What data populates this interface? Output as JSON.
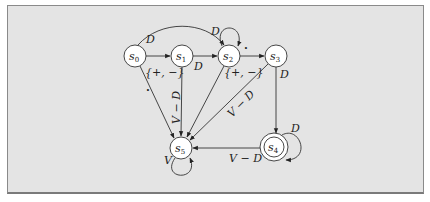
{
  "diagram": {
    "type": "state-machine",
    "nodes": [
      {
        "id": "s0",
        "label": "s",
        "sub": "0",
        "x": 135,
        "y": 56,
        "accepting": false
      },
      {
        "id": "s1",
        "label": "s",
        "sub": "1",
        "x": 182,
        "y": 56,
        "accepting": false
      },
      {
        "id": "s2",
        "label": "s",
        "sub": "2",
        "x": 229,
        "y": 56,
        "accepting": false
      },
      {
        "id": "s3",
        "label": "s",
        "sub": "3",
        "x": 276,
        "y": 56,
        "accepting": false
      },
      {
        "id": "s4",
        "label": "s",
        "sub": "4",
        "x": 274,
        "y": 147,
        "accepting": true
      },
      {
        "id": "s5",
        "label": "s",
        "sub": "5",
        "x": 181,
        "y": 148,
        "accepting": false
      }
    ],
    "edges": [
      {
        "from": "s0",
        "to": "s1",
        "label": "{+, −}"
      },
      {
        "from": "s0",
        "to": "s2",
        "label": "D"
      },
      {
        "from": "s0",
        "to": "s5",
        "label": "·"
      },
      {
        "from": "s1",
        "to": "s2",
        "label": "D"
      },
      {
        "from": "s1",
        "to": "s5",
        "label": "V − D"
      },
      {
        "from": "s2",
        "to": "s2",
        "label": "D"
      },
      {
        "from": "s2",
        "to": "s3",
        "label": "·"
      },
      {
        "from": "s2",
        "to": "s5",
        "label": "{+, −}"
      },
      {
        "from": "s3",
        "to": "s4",
        "label": "D"
      },
      {
        "from": "s3",
        "to": "s5",
        "label": "V − D"
      },
      {
        "from": "s4",
        "to": "s4",
        "label": "D"
      },
      {
        "from": "s4",
        "to": "s5",
        "label": "V − D"
      },
      {
        "from": "s5",
        "to": "s5",
        "label": "V"
      }
    ]
  },
  "labels": {
    "s0_name": "s",
    "s0_sub": "0",
    "s1_name": "s",
    "s1_sub": "1",
    "s2_name": "s",
    "s2_sub": "2",
    "s3_name": "s",
    "s3_sub": "3",
    "s4_name": "s",
    "s4_sub": "4",
    "s5_name": "s",
    "s5_sub": "5",
    "e_s0_s1": "{+, −}",
    "e_s0_s2": "D",
    "e_s0_s5": "·",
    "e_s1_s2": "D",
    "e_s1_s5": "V − D",
    "e_s2_s2": "D",
    "e_s2_s3": "·",
    "e_s2_s5": "{+, −}",
    "e_s3_s4": "D",
    "e_s3_s5": "V − D",
    "e_s4_s4": "D",
    "e_s4_s5": "V − D",
    "e_s5_s5": "V"
  },
  "colors": {
    "background": "#e4e4e4",
    "node_fill": "#ffffff",
    "stroke": "#333333"
  }
}
